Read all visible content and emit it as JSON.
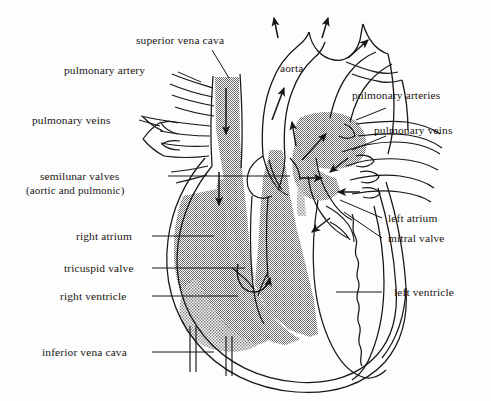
{
  "diagram": {
    "style": "black-and-white line drawing with halftone shading",
    "colors": {
      "background": "#fdfdfd",
      "ink": "#1a1613",
      "shading_gray": "#9a9a9a",
      "shading_light": "#b5b5b5"
    }
  },
  "labels": {
    "superior_vena_cava": "superior vena cava",
    "pulmonary_artery": "pulmonary artery",
    "pulmonary_veins_left": "pulmonary veins",
    "semilunar_valves_line1": "semilunar valves",
    "semilunar_valves_line2": "(aortic and pulmonic)",
    "right_atrium": "right atrium",
    "tricuspid_valve": "tricuspid valve",
    "right_ventricle": "right ventricle",
    "inferior_vena_cava": "inferior vena cava",
    "aorta": "aorta",
    "pulmonary_arteries_right": "pulmonary arteries",
    "pulmonary_veins_right": "pulmonary veins",
    "left_atrium": "left atrium",
    "mitral_valve": "mitral valve",
    "left_ventricle": "left ventricle"
  },
  "flow_arrows": [
    {
      "name": "svc-inflow",
      "direction": "down",
      "region": "superior vena cava"
    },
    {
      "name": "right-atrium-downflow",
      "direction": "down",
      "region": "right atrium"
    },
    {
      "name": "tricuspid-flow",
      "direction": "curved-up",
      "region": "tricuspid valve into right ventricle"
    },
    {
      "name": "aorta-outflow",
      "direction": "up",
      "region": "ascending aorta"
    },
    {
      "name": "aortic-arch-branch-1",
      "direction": "up",
      "region": "brachiocephalic trunk"
    },
    {
      "name": "aortic-arch-branch-2",
      "direction": "up-right",
      "region": "left common carotid"
    },
    {
      "name": "aortic-arch-branch-3",
      "direction": "up-right",
      "region": "left subclavian"
    },
    {
      "name": "pulmonary-trunk-outflow",
      "direction": "up",
      "region": "pulmonary trunk"
    },
    {
      "name": "pulmonary-artery-outflow",
      "direction": "up-right",
      "region": "right pulmonary artery"
    },
    {
      "name": "pulmonary-vein-inflow-1",
      "direction": "down-left",
      "region": "left atrium"
    },
    {
      "name": "pulmonary-vein-inflow-2",
      "direction": "left",
      "region": "left atrium"
    },
    {
      "name": "pulmonary-vein-inflow-3",
      "direction": "down-left",
      "region": "left atrium"
    },
    {
      "name": "mitral-flow",
      "direction": "down-left",
      "region": "mitral valve into left ventricle"
    },
    {
      "name": "left-atrium-outflow",
      "direction": "right",
      "region": "left atrium"
    }
  ]
}
